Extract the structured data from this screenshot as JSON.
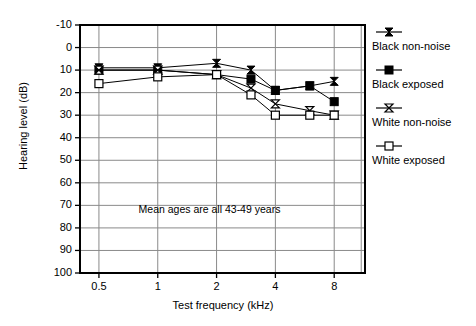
{
  "chart_data": {
    "type": "line",
    "title": "",
    "xlabel": "Test frequency (kHz)",
    "ylabel": "Hearing level (dB)",
    "xscale": "log",
    "x": [
      0.5,
      1,
      2,
      3,
      4,
      6,
      8
    ],
    "xticks": [
      0.5,
      1,
      2,
      4,
      8
    ],
    "xticklabels": [
      "0.5",
      "1",
      "2",
      "4",
      "8"
    ],
    "yticks": [
      -10,
      0,
      10,
      20,
      30,
      40,
      50,
      60,
      70,
      80,
      90,
      100
    ],
    "yticklabels": [
      "-10",
      "0",
      "10",
      "20",
      "30",
      "40",
      "50",
      "60",
      "70",
      "80",
      "90",
      "100"
    ],
    "ylim": [
      -10,
      100
    ],
    "y_inverted": true,
    "grid": true,
    "legend_position": "right",
    "annotations": [
      {
        "text": "Mean ages are all 43-49 years",
        "x": 2.0,
        "y": 72
      }
    ],
    "series": [
      {
        "name": "Black non-noise",
        "marker": "bowtie-filled",
        "color": "#000000",
        "values": [
          9,
          9,
          7,
          10,
          19,
          17,
          15
        ]
      },
      {
        "name": "Black exposed",
        "marker": "square-filled",
        "color": "#000000",
        "values": [
          10,
          10,
          12,
          14,
          19,
          17,
          24
        ]
      },
      {
        "name": "White non-noise",
        "marker": "bowtie-open",
        "color": "#000000",
        "values": [
          10,
          10,
          12,
          18,
          25,
          28,
          30
        ]
      },
      {
        "name": "White exposed",
        "marker": "square-open",
        "color": "#000000",
        "values": [
          16,
          13,
          12,
          21,
          30,
          30,
          30
        ]
      }
    ]
  },
  "legend": {
    "items": [
      {
        "label": "Black non-noise"
      },
      {
        "label": "Black exposed"
      },
      {
        "label": "White non-noise"
      },
      {
        "label": "White exposed"
      }
    ]
  },
  "axes": {
    "y_title": "Hearing level (dB)",
    "x_title": "Test frequency (kHz)"
  },
  "annotation": {
    "text": "Mean ages are all 43-49 years"
  },
  "colors": {
    "frame": "#000000",
    "grid": "#8a8a8a",
    "series": "#000000",
    "background": "#ffffff"
  }
}
